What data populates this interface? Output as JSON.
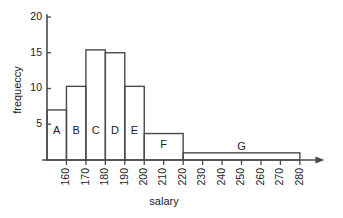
{
  "chart_data": {
    "type": "bar",
    "title": "",
    "xlabel": "salary",
    "ylabel": "frequeccy",
    "xlim": [
      150,
      285
    ],
    "ylim": [
      0,
      20
    ],
    "grid": false,
    "legend": "none",
    "x_ticks": [
      "160",
      "170",
      "180",
      "190",
      "200",
      "210",
      "220",
      "230",
      "240",
      "250",
      "260",
      "270",
      "280"
    ],
    "x_tick_values": [
      160,
      170,
      180,
      190,
      200,
      210,
      220,
      230,
      240,
      250,
      260,
      270,
      280
    ],
    "y_ticks": [
      "5",
      "10",
      "15",
      "20"
    ],
    "y_tick_values": [
      5,
      10,
      15,
      20
    ],
    "bars": [
      {
        "label": "A",
        "x_start": 150,
        "x_end": 160,
        "value": 7
      },
      {
        "label": "B",
        "x_start": 160,
        "x_end": 170,
        "value": 10.3
      },
      {
        "label": "C",
        "x_start": 170,
        "x_end": 180,
        "value": 15.4
      },
      {
        "label": "D",
        "x_start": 180,
        "x_end": 190,
        "value": 15
      },
      {
        "label": "E",
        "x_start": 190,
        "x_end": 200,
        "value": 10.3
      },
      {
        "label": "F",
        "x_start": 200,
        "x_end": 220,
        "value": 3.7
      },
      {
        "label": "G",
        "x_start": 220,
        "x_end": 280,
        "value": 1
      }
    ],
    "categories": [
      "A",
      "B",
      "C",
      "D",
      "E",
      "F",
      "G"
    ],
    "values": [
      7,
      10.3,
      15.4,
      15,
      10.3,
      3.7,
      1
    ],
    "colors": {
      "stroke": "#4a4a4a",
      "fill": "#ffffff",
      "text": "#1a1a1a",
      "background": "#ffffff"
    }
  }
}
